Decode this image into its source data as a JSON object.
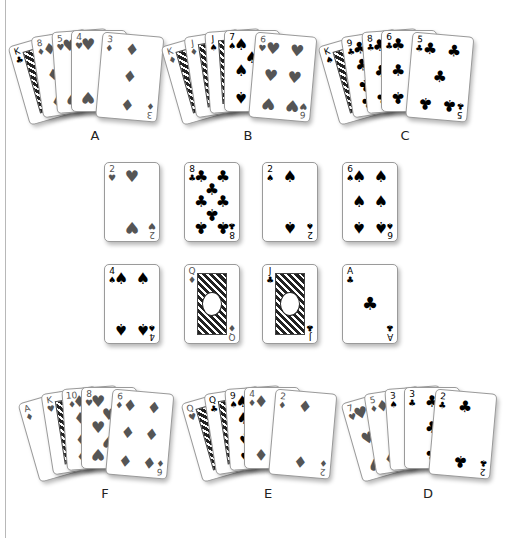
{
  "figure": {
    "suit_colors": {
      "red_suits": "#555555",
      "black_suits": "#000000"
    },
    "hands": {
      "A": {
        "label": "A",
        "cards": [
          {
            "rank": "K",
            "suit": "♣"
          },
          {
            "rank": "8",
            "suit": "♦"
          },
          {
            "rank": "5",
            "suit": "♥"
          },
          {
            "rank": "4",
            "suit": "♥"
          },
          {
            "rank": "3",
            "suit": "♦"
          }
        ]
      },
      "B": {
        "label": "B",
        "cards": [
          {
            "rank": "K",
            "suit": "♦"
          },
          {
            "rank": "J",
            "suit": "♦"
          },
          {
            "rank": "J",
            "suit": "♠"
          },
          {
            "rank": "7",
            "suit": "♠"
          },
          {
            "rank": "6",
            "suit": "♥"
          }
        ]
      },
      "C": {
        "label": "C",
        "cards": [
          {
            "rank": "K",
            "suit": "♠"
          },
          {
            "rank": "9",
            "suit": "♣"
          },
          {
            "rank": "8",
            "suit": "♣"
          },
          {
            "rank": "6",
            "suit": "♣"
          },
          {
            "rank": "5",
            "suit": "♣"
          }
        ]
      },
      "F": {
        "label": "F",
        "cards": [
          {
            "rank": "A",
            "suit": "♦"
          },
          {
            "rank": "K",
            "suit": "♥"
          },
          {
            "rank": "10",
            "suit": "♦"
          },
          {
            "rank": "8",
            "suit": "♥"
          },
          {
            "rank": "6",
            "suit": "♦"
          }
        ]
      },
      "E": {
        "label": "E",
        "cards": [
          {
            "rank": "Q",
            "suit": "♥"
          },
          {
            "rank": "Q",
            "suit": "♣"
          },
          {
            "rank": "9",
            "suit": "♠"
          },
          {
            "rank": "4",
            "suit": "♦"
          },
          {
            "rank": "2",
            "suit": "♦"
          }
        ]
      },
      "D": {
        "label": "D",
        "cards": [
          {
            "rank": "7",
            "suit": "♥"
          },
          {
            "rank": "5",
            "suit": "♦"
          },
          {
            "rank": "3",
            "suit": "♠"
          },
          {
            "rank": "3",
            "suit": "♣"
          },
          {
            "rank": "2",
            "suit": "♣"
          }
        ]
      }
    },
    "grid": {
      "row1": [
        {
          "rank": "2",
          "suit": "♥"
        },
        {
          "rank": "8",
          "suit": "♣"
        },
        {
          "rank": "2",
          "suit": "♠"
        },
        {
          "rank": "6",
          "suit": "♠"
        }
      ],
      "row2": [
        {
          "rank": "4",
          "suit": "♠"
        },
        {
          "rank": "Q",
          "suit": "♦"
        },
        {
          "rank": "J",
          "suit": "♣"
        },
        {
          "rank": "A",
          "suit": "♣"
        }
      ]
    }
  }
}
